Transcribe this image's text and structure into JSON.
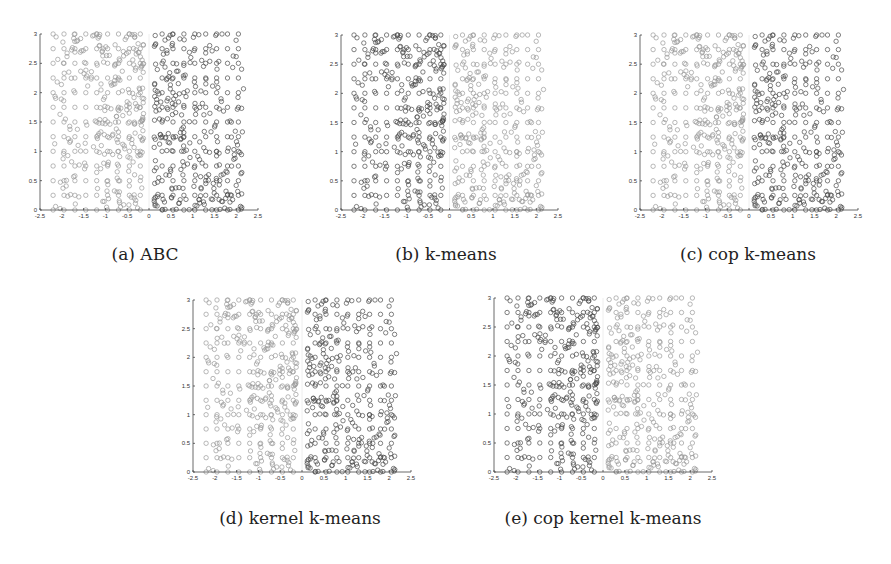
{
  "figure": {
    "captions": [
      {
        "id": "a",
        "label": "(a) ABC"
      },
      {
        "id": "b",
        "label": "(b) k-means"
      },
      {
        "id": "c",
        "label": "(c) cop k-means"
      },
      {
        "id": "d",
        "label": "(d) kernel k-means"
      },
      {
        "id": "e",
        "label": "(e) cop kernel k-means"
      }
    ]
  },
  "chart_data": [
    {
      "type": "scatter",
      "id": "a",
      "title": "(a) ABC",
      "xlabel": "",
      "ylabel": "",
      "xlim": [
        -2.5,
        2.5
      ],
      "ylim": [
        0,
        3
      ],
      "xticks": [
        -2.5,
        -2,
        -1.5,
        -1,
        -0.5,
        0,
        0.5,
        1,
        1.5,
        2,
        2.5
      ],
      "yticks": [
        0,
        0.5,
        1,
        1.5,
        2,
        2.5,
        3
      ],
      "grid": false,
      "marker": "open-circle",
      "series": [
        {
          "name": "cluster-left (x<0)",
          "shade": "light",
          "color": "#9a9a9a",
          "x_range": [
            -2.2,
            -0.1
          ],
          "y_range": [
            0,
            3
          ],
          "density": "denser near top and x≈-0.5"
        },
        {
          "name": "cluster-right (x>0)",
          "shade": "dark",
          "color": "#4a4a4a",
          "x_range": [
            0.1,
            2.2
          ],
          "y_range": [
            0,
            3
          ],
          "density": "denser near bottom and x≈0.5"
        }
      ]
    },
    {
      "type": "scatter",
      "id": "b",
      "title": "(b) k-means",
      "xlim": [
        -2.5,
        2.5
      ],
      "ylim": [
        0,
        3
      ],
      "xticks": [
        -2.5,
        -2,
        -1.5,
        -1,
        -0.5,
        0,
        0.5,
        1,
        1.5,
        2,
        2.5
      ],
      "yticks": [
        0,
        0.5,
        1,
        1.5,
        2,
        2.5,
        3
      ],
      "grid": false,
      "marker": "open-circle",
      "series": [
        {
          "name": "cluster-left (x<0)",
          "shade": "dark",
          "color": "#4a4a4a",
          "x_range": [
            -2.2,
            -0.1
          ],
          "y_range": [
            0,
            3
          ]
        },
        {
          "name": "cluster-right (x>0)",
          "shade": "light",
          "color": "#9a9a9a",
          "x_range": [
            0.1,
            2.2
          ],
          "y_range": [
            0,
            3
          ]
        }
      ]
    },
    {
      "type": "scatter",
      "id": "c",
      "title": "(c) cop k-means",
      "xlim": [
        -2.5,
        2.5
      ],
      "ylim": [
        0,
        3
      ],
      "xticks": [
        -2.5,
        -2,
        -1.5,
        -1,
        -0.5,
        0,
        0.5,
        1,
        1.5,
        2,
        2.5
      ],
      "yticks": [
        0,
        0.5,
        1,
        1.5,
        2,
        2.5,
        3
      ],
      "grid": false,
      "marker": "open-circle",
      "series": [
        {
          "name": "cluster-left (x<0)",
          "shade": "light",
          "color": "#9a9a9a",
          "x_range": [
            -2.2,
            -0.1
          ],
          "y_range": [
            0,
            3
          ]
        },
        {
          "name": "cluster-right (x>0)",
          "shade": "dark",
          "color": "#4a4a4a",
          "x_range": [
            0.1,
            2.2
          ],
          "y_range": [
            0,
            3
          ]
        }
      ]
    },
    {
      "type": "scatter",
      "id": "d",
      "title": "(d) kernel k-means",
      "xlim": [
        -2.5,
        2.5
      ],
      "ylim": [
        0,
        3
      ],
      "xticks": [
        -2.5,
        -2,
        -1.5,
        -1,
        -0.5,
        0,
        0.5,
        1,
        1.5,
        2,
        2.5
      ],
      "yticks": [
        0,
        0.5,
        1,
        1.5,
        2,
        2.5,
        3
      ],
      "grid": false,
      "marker": "open-circle",
      "series": [
        {
          "name": "cluster-left (x<0)",
          "shade": "light",
          "color": "#9a9a9a",
          "x_range": [
            -2.2,
            -0.1
          ],
          "y_range": [
            0,
            3
          ]
        },
        {
          "name": "cluster-right (x>0)",
          "shade": "dark",
          "color": "#4a4a4a",
          "x_range": [
            0.1,
            2.2
          ],
          "y_range": [
            0,
            3
          ]
        }
      ]
    },
    {
      "type": "scatter",
      "id": "e",
      "title": "(e) cop kernel k-means",
      "xlim": [
        -2.5,
        2.5
      ],
      "ylim": [
        0,
        3
      ],
      "xticks": [
        -2.5,
        -2,
        -1.5,
        -1,
        -0.5,
        0,
        0.5,
        1,
        1.5,
        2,
        2.5
      ],
      "yticks": [
        0,
        0.5,
        1,
        1.5,
        2,
        2.5,
        3
      ],
      "grid": false,
      "marker": "open-circle",
      "series": [
        {
          "name": "cluster-left (x<0)",
          "shade": "dark",
          "color": "#4a4a4a",
          "x_range": [
            -2.2,
            -0.1
          ],
          "y_range": [
            0,
            3
          ]
        },
        {
          "name": "cluster-right (x>0)",
          "shade": "light",
          "color": "#9a9a9a",
          "x_range": [
            0.1,
            2.2
          ],
          "y_range": [
            0,
            3
          ]
        }
      ]
    }
  ],
  "layout": {
    "panels": [
      {
        "id": "a",
        "x0": 40,
        "x1": 258,
        "y0": 34,
        "y1": 210,
        "caption_x": 145,
        "caption_y": 244
      },
      {
        "id": "b",
        "x0": 341,
        "x1": 558,
        "y0": 35,
        "y1": 210,
        "caption_x": 446,
        "caption_y": 244
      },
      {
        "id": "c",
        "x0": 640,
        "x1": 858,
        "y0": 35,
        "y1": 210,
        "caption_x": 748,
        "caption_y": 244
      },
      {
        "id": "d",
        "x0": 193,
        "x1": 411,
        "y0": 300,
        "y1": 472,
        "caption_x": 300,
        "caption_y": 508
      },
      {
        "id": "e",
        "x0": 494,
        "x1": 712,
        "y0": 298,
        "y1": 472,
        "caption_x": 603,
        "caption_y": 508
      }
    ]
  }
}
